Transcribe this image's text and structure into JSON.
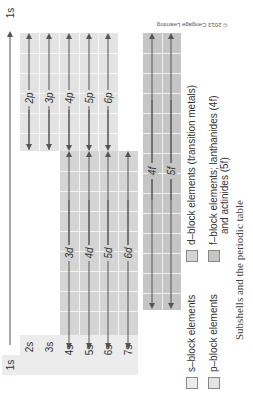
{
  "figure": {
    "caption": "Subshells and the periodic table",
    "copyright": "© 2013 Cengage Learning",
    "orientation": "rotated 90° counterclockwise"
  },
  "colors": {
    "s_block": "#ececec",
    "p_block": "#e3e3e3",
    "d_block": "#d4d4d4",
    "f_block": "#c5c5c5",
    "arrow": "#555555"
  },
  "subshells": {
    "s": [
      "1s",
      "2s",
      "3s",
      "4s",
      "5s",
      "6s",
      "7s"
    ],
    "p": [
      "2p",
      "3p",
      "4p",
      "5p",
      "6p"
    ],
    "d": [
      "3d",
      "4d",
      "5d",
      "6d"
    ],
    "f": [
      "4f",
      "5f"
    ]
  },
  "labels": {
    "s1_top": "1s",
    "s1_bottom": "1s",
    "s2": "2s",
    "s3": "3s",
    "s4": "4s",
    "s5": "5s",
    "s6": "6s",
    "s7": "7s",
    "p2": "2p",
    "p3": "3p",
    "p4": "4p",
    "p5": "5p",
    "p6": "6p",
    "d3": "3d",
    "d4": "4d",
    "d5": "5d",
    "d6": "6d",
    "f4": "4f",
    "f5": "5f"
  },
  "legend": {
    "s_block": "s–block elements",
    "p_block": "p–block elements",
    "d_block": "d–block elements (transition metals)",
    "f_block_line1": "f–block elements; lanthanides (4f)",
    "f_block_line2": "and actinides (5f)"
  }
}
